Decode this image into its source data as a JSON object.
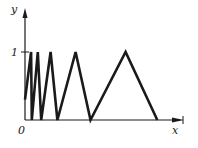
{
  "chart_data": {
    "type": "line",
    "title": "",
    "xlabel": "x",
    "ylabel": "y",
    "origin_label": "0",
    "y_ticks": [
      {
        "value": 1,
        "label": "1"
      }
    ],
    "x_ticks": [],
    "grid": false,
    "legend": null,
    "series": [
      {
        "name": "y(x)",
        "x": [
          0.0,
          0.045,
          0.05,
          0.095,
          0.12,
          0.19,
          0.24,
          0.375,
          0.485,
          0.745,
          0.98
        ],
        "y": [
          0.3,
          1.0,
          0.0,
          1.0,
          0.0,
          1.0,
          0.0,
          1.0,
          0.0,
          1.0,
          0.0
        ]
      }
    ],
    "colors": {
      "line": "#1a1a1a",
      "axis": "#1a1a1a",
      "background": "#ffffff"
    }
  }
}
